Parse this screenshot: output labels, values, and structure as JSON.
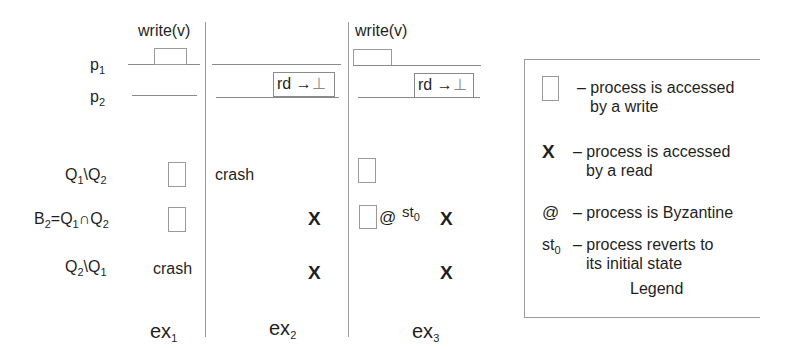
{
  "diagram": {
    "process_labels": [
      {
        "base": "p",
        "sub": "1"
      },
      {
        "base": "p",
        "sub": "2"
      }
    ],
    "write_label": "write(v)",
    "read_label": {
      "text": "rd",
      "arrow": "→",
      "result": "⊥"
    },
    "row_labels": [
      {
        "parts": [
          {
            "t": "Q"
          },
          {
            "s": "1"
          },
          {
            "t": "\\Q"
          },
          {
            "s": "2"
          }
        ]
      },
      {
        "parts": [
          {
            "t": "B"
          },
          {
            "s": "2"
          },
          {
            "t": "=Q"
          },
          {
            "s": "1"
          },
          {
            "t": "∩Q"
          },
          {
            "s": "2"
          }
        ]
      },
      {
        "parts": [
          {
            "t": "Q"
          },
          {
            "s": "2"
          },
          {
            "t": "\\Q"
          },
          {
            "s": "1"
          }
        ]
      }
    ],
    "executions": [
      {
        "name": {
          "base": "ex",
          "sub": "1"
        },
        "p1": "write",
        "p2": "none",
        "rows": [
          "write-box",
          "write-box",
          "crash"
        ]
      },
      {
        "name": {
          "base": "ex",
          "sub": "2"
        },
        "p1": "none",
        "p2": "read",
        "rows": [
          "crash",
          "X",
          "X"
        ]
      },
      {
        "name": {
          "base": "ex",
          "sub": "3"
        },
        "p1": "write",
        "p2": "read",
        "rows": [
          "write-box",
          "write-box @ st0 X",
          "X"
        ]
      }
    ],
    "crash_label": "crash",
    "x_mark": "X",
    "byz_mark": "@",
    "st0": {
      "base": "st",
      "sub": "0"
    }
  },
  "legend": {
    "title": "Legend",
    "items": [
      {
        "symbol": "square",
        "line1": "– process is accessed",
        "line2": "by a write"
      },
      {
        "symbol": "X",
        "line1": "– process is accessed",
        "line2": "by a read"
      },
      {
        "symbol": "@",
        "line1": "– process is Byzantine",
        "line2": ""
      },
      {
        "symbol": "st0",
        "line1": "– process reverts to",
        "line2": "its initial state"
      }
    ]
  }
}
